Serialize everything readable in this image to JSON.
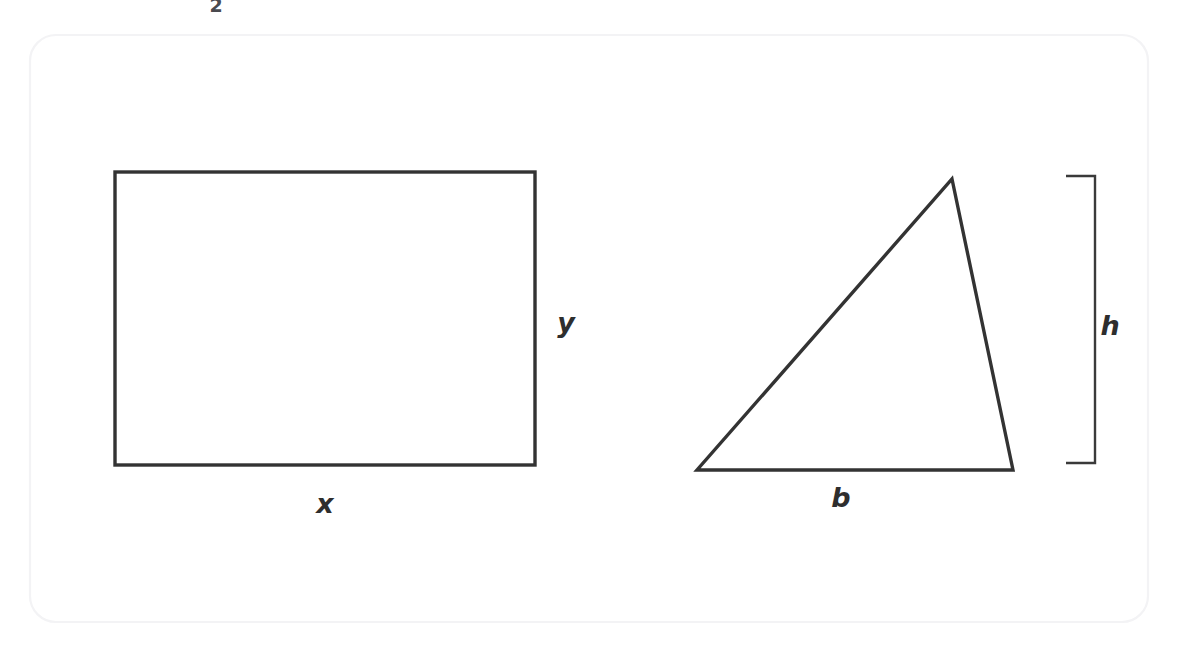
{
  "figure": {
    "kind": "geometry-diagram",
    "background_color": "#ffffff",
    "stroke_color": "#333333",
    "stroke_width": 3,
    "frame": {
      "name": "page-frame",
      "color": "#f4f4f6",
      "x": 30,
      "y": 35,
      "width": 1118,
      "height": 587,
      "radius": 26
    },
    "stray_mark": {
      "text": "2",
      "x": 216,
      "y": 5
    },
    "rectangle": {
      "x": 115,
      "y": 172,
      "width": 420,
      "height": 293,
      "labels": {
        "width_label": {
          "text": "x",
          "x": 325,
          "y": 503
        },
        "height_label": {
          "text": "y",
          "x": 566,
          "y": 322
        }
      }
    },
    "triangle": {
      "apex": {
        "x": 952,
        "y": 179
      },
      "bottom_left": {
        "x": 697,
        "y": 470
      },
      "bottom_right": {
        "x": 1013,
        "y": 470
      },
      "labels": {
        "base_label": {
          "text": "b",
          "x": 841,
          "y": 497
        },
        "height_label": {
          "text": "h",
          "x": 1110,
          "y": 325
        }
      },
      "height_bracket": {
        "x": 1095,
        "top_y": 176,
        "bottom_y": 463,
        "arm_length": 29
      }
    }
  }
}
